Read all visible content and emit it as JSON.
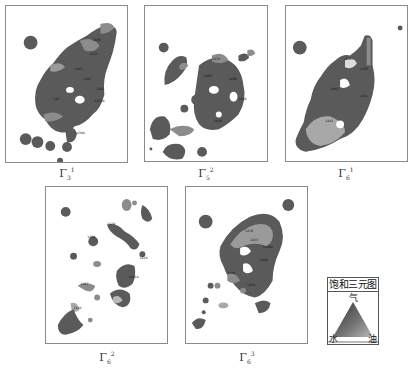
{
  "figure": {
    "panels": [
      {
        "id": "panel-1",
        "caption_base": "Γ",
        "caption_sub": "3",
        "caption_sup": "1"
      },
      {
        "id": "panel-2",
        "caption_base": "Γ",
        "caption_sub": "5",
        "caption_sup": "2"
      },
      {
        "id": "panel-3",
        "caption_base": "Γ",
        "caption_sub": "6",
        "caption_sup": "1"
      },
      {
        "id": "panel-4",
        "caption_base": "Γ",
        "caption_sub": "6",
        "caption_sup": "2"
      },
      {
        "id": "panel-5",
        "caption_base": "Γ",
        "caption_sub": "6",
        "caption_sup": "3"
      }
    ],
    "legend": {
      "title": "饱和三元图",
      "top_label": "气",
      "left_label": "水",
      "right_label": "油"
    },
    "colors": {
      "dark": "#5a5a5a",
      "mid": "#8c8c8c",
      "light": "#b8b8b8",
      "border": "#8a8a8a"
    }
  }
}
